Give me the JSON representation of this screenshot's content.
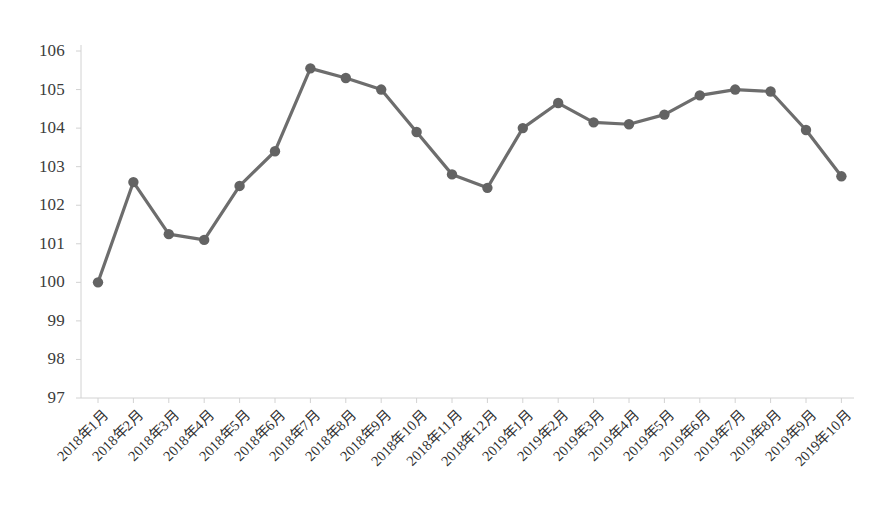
{
  "chart_data": {
    "type": "line",
    "title": "",
    "subtitle": "",
    "xlabel": "",
    "ylabel": "",
    "ylim": [
      97,
      106
    ],
    "yticks": [
      97,
      98,
      99,
      100,
      101,
      102,
      103,
      104,
      105,
      106
    ],
    "grid": false,
    "legend": "none",
    "marker": "circle",
    "line_color": "#6d6d6d",
    "marker_color": "#636363",
    "axis_color": "#d2d2d2",
    "categories": [
      "2018年1月",
      "2018年2月",
      "2018年3月",
      "2018年4月",
      "2018年5月",
      "2018年6月",
      "2018年7月",
      "2018年8月",
      "2018年9月",
      "2018年10月",
      "2018年11月",
      "2018年12月",
      "2019年1月",
      "2019年2月",
      "2019年3月",
      "2019年4月",
      "2019年5月",
      "2019年6月",
      "2019年7月",
      "2019年8月",
      "2019年9月",
      "2019年10月"
    ],
    "values": [
      100.0,
      102.6,
      101.25,
      101.1,
      102.5,
      103.4,
      105.55,
      105.3,
      105.0,
      103.9,
      102.8,
      102.45,
      104.0,
      104.65,
      104.15,
      104.1,
      104.35,
      104.85,
      105.0,
      104.95,
      103.95,
      102.75
    ]
  }
}
